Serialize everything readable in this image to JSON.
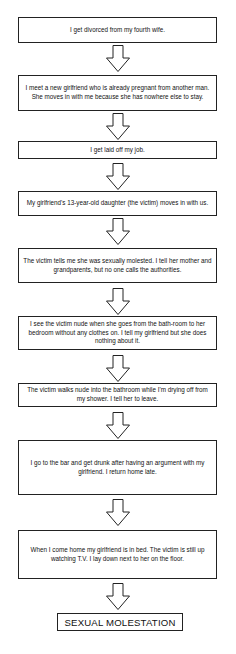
{
  "flowchart": {
    "steps": [
      {
        "text": "I get divorced from my fourth wife."
      },
      {
        "text": "I meet a new girlfriend who is already pregnant from another man.  She moves in with me because she has nowhere else to stay."
      },
      {
        "text": "I get laid off my job."
      },
      {
        "text": "My girlfriend's 13-year-old daughter (the victim) moves in with us."
      },
      {
        "text": "The victim tells me she was sexually molested.  I tell her mother and grandparents, but no one calls the authorities."
      },
      {
        "text": "I see the victim nude when she goes from the bath-room to her bedroom without any clothes on.  I tell my girlfriend but she does nothing about it."
      },
      {
        "text": "The victim walks nude into the bathroom while I'm drying off from my shower.  I tell her to leave."
      },
      {
        "text": "I go to the bar and get drunk after having an argument with my girlfriend.  I return home late."
      },
      {
        "text": "When I come home my girlfriend is in bed.  The victim is still up watching T.V.  I lay down next to her on the floor."
      }
    ],
    "outcome": "SEXUAL MOLESTATION",
    "arrow_icon": "down-arrow-outline",
    "colors": {
      "border": "#222222",
      "background": "#ffffff",
      "text": "#111111"
    }
  }
}
